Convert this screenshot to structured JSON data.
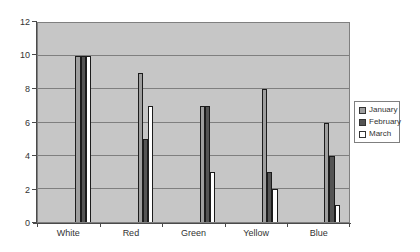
{
  "chart_data": {
    "type": "bar",
    "title": "",
    "xlabel": "",
    "ylabel": "",
    "categories": [
      "White",
      "Red",
      "Green",
      "Yellow",
      "Blue"
    ],
    "series": [
      {
        "name": "January",
        "color": "#9e9e9e",
        "values": [
          10,
          9,
          7,
          8,
          6
        ]
      },
      {
        "name": "February",
        "color": "#545454",
        "values": [
          10,
          5,
          7,
          3,
          4
        ]
      },
      {
        "name": "March",
        "color": "#ffffff",
        "values": [
          10,
          7,
          3,
          2,
          1
        ]
      }
    ],
    "ylim": [
      0,
      12
    ],
    "ytick_step": 2,
    "ytick_labels": [
      "0",
      "2",
      "4",
      "6",
      "8",
      "10",
      "12"
    ],
    "grid": true,
    "legend_position": "right",
    "colors": {
      "plot_background": "#c6c6c6",
      "gridline": "#7f7f7f",
      "axis_line": "#4a4a4a",
      "bar_border": "#1c1c1c",
      "text": "#333333",
      "canvas_background": "#ffffff",
      "legend_border": "#7f7f7f"
    }
  }
}
